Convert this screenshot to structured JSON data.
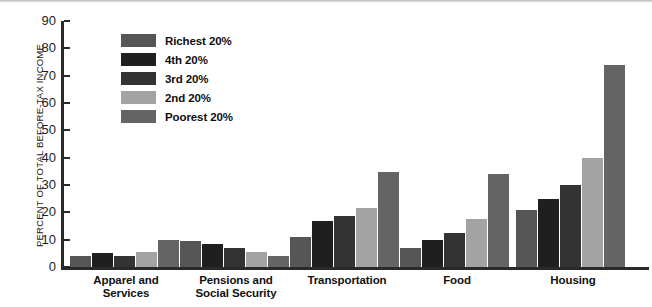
{
  "chart_data": {
    "type": "bar",
    "title": "",
    "xlabel": "",
    "ylabel": "PERCENT OF TOTAL BEFORE-TAX INCOME",
    "ylim": [
      0,
      90
    ],
    "yticks": [
      0,
      10,
      20,
      30,
      40,
      50,
      60,
      70,
      80,
      90
    ],
    "grid": false,
    "legend_position": "upper-left-inside",
    "categories": [
      "Apparel and\nServices",
      "Pensions and\nSocial Security",
      "Transportation",
      "Food",
      "Housing"
    ],
    "category_lines": [
      [
        "Apparel and",
        "Services"
      ],
      [
        "Pensions and",
        "Social Security"
      ],
      [
        "Transportation"
      ],
      [
        "Food"
      ],
      [
        "Housing"
      ]
    ],
    "series": [
      {
        "name": "Richest 20%",
        "color": "#565656",
        "values": [
          4.0,
          9.5,
          11.0,
          7.0,
          21.0
        ]
      },
      {
        "name": "4th 20%",
        "color": "#1f1f1f",
        "values": [
          5.0,
          8.5,
          17.0,
          10.0,
          25.0
        ]
      },
      {
        "name": "3rd 20%",
        "color": "#333333",
        "values": [
          4.0,
          7.0,
          18.5,
          12.5,
          30.0
        ]
      },
      {
        "name": "2nd 20%",
        "color": "#a3a3a3",
        "values": [
          5.5,
          5.5,
          21.5,
          17.5,
          40.0
        ]
      },
      {
        "name": "Poorest 20%",
        "color": "#646464",
        "values": [
          10.0,
          4.0,
          34.7,
          34.0,
          73.8
        ]
      }
    ]
  },
  "axis": {
    "y_title": "PERCENT OF TOTAL BEFORE-TAX INCOME",
    "tick_labels": [
      "90",
      "80",
      "70",
      "60",
      "50",
      "40",
      "30",
      "20",
      "10",
      "0"
    ]
  },
  "legend": {
    "items": [
      {
        "label": "Richest 20%",
        "color": "#565656"
      },
      {
        "label": "4th 20%",
        "color": "#1f1f1f"
      },
      {
        "label": "3rd 20%",
        "color": "#333333"
      },
      {
        "label": "2nd 20%",
        "color": "#a3a3a3"
      },
      {
        "label": "Poorest 20%",
        "color": "#646464"
      }
    ]
  },
  "colors": {
    "axis": "#2a2a2a",
    "text": "#111111",
    "background": "#ffffff"
  }
}
